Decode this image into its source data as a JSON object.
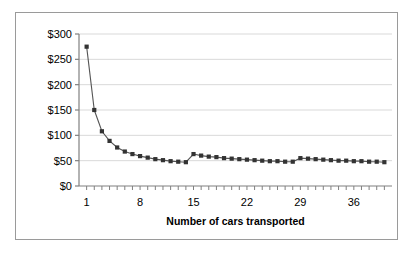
{
  "chart_data": {
    "type": "line",
    "title": "",
    "subtitle": "",
    "xlabel": "Number of cars transported",
    "ylabel": "",
    "xlim": [
      0,
      41
    ],
    "ylim": [
      0,
      300
    ],
    "grid": "horizontal",
    "legend": "none",
    "marker": "square",
    "series_color": "#333333",
    "line_color": "#555555",
    "gridline_color": "#d9d9d9",
    "axis_color": "#808080",
    "x": [
      1,
      2,
      3,
      4,
      5,
      6,
      7,
      8,
      9,
      10,
      11,
      12,
      13,
      14,
      15,
      16,
      17,
      18,
      19,
      20,
      21,
      22,
      23,
      24,
      25,
      26,
      27,
      28,
      29,
      30,
      31,
      32,
      33,
      34,
      35,
      36,
      37,
      38,
      39,
      40
    ],
    "values": [
      275,
      150,
      108,
      89,
      76,
      68,
      63,
      59,
      56,
      53,
      51,
      49,
      48,
      47,
      63,
      60,
      58,
      57,
      55,
      54,
      53,
      52,
      51,
      50,
      49,
      49,
      48,
      48,
      55,
      54,
      53,
      52,
      51,
      50,
      50,
      49,
      49,
      48,
      48,
      47
    ],
    "ytick_values": [
      0,
      50,
      100,
      150,
      200,
      250,
      300
    ],
    "ytick_labels": [
      "$0",
      "$50",
      "$100",
      "$150",
      "$200",
      "$250",
      "$300"
    ],
    "xtick_values": [
      1,
      8,
      15,
      22,
      29,
      36
    ],
    "xtick_labels": [
      "1",
      "8",
      "15",
      "22",
      "29",
      "36"
    ],
    "minor_xticks": [
      1,
      2,
      3,
      4,
      5,
      6,
      7,
      8,
      9,
      10,
      11,
      12,
      13,
      14,
      15,
      16,
      17,
      18,
      19,
      20,
      21,
      22,
      23,
      24,
      25,
      26,
      27,
      28,
      29,
      30,
      31,
      32,
      33,
      34,
      35,
      36,
      37,
      38,
      39,
      40
    ],
    "annotations": []
  },
  "figure": {
    "background_color": "#ffffff",
    "border_color": "#9a9a9a"
  }
}
